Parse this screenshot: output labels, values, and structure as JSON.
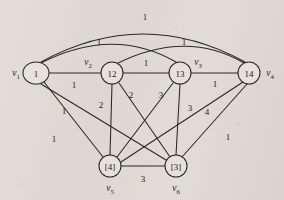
{
  "diagram": {
    "type": "weighted-undirected-graph",
    "title": "",
    "background_color": "#ded9d2",
    "stroke_color": "#2a2724",
    "node_fill": "#e6e2db",
    "nodes": [
      {
        "id": "v1",
        "label": "1",
        "vertex_label": "v",
        "vertex_sub": "1",
        "cx": 36,
        "cy": 73,
        "r": 11,
        "rx": 13,
        "label_x": 16,
        "label_y": 73
      },
      {
        "id": "v2",
        "label": "12",
        "vertex_label": "v",
        "vertex_sub": "2",
        "cx": 112,
        "cy": 73,
        "r": 11,
        "rx": 11,
        "label_x": 88,
        "label_y": 62
      },
      {
        "id": "v3",
        "label": "13",
        "vertex_label": "v",
        "vertex_sub": "3",
        "cx": 180,
        "cy": 73,
        "r": 11,
        "rx": 11,
        "label_x": 198,
        "label_y": 62
      },
      {
        "id": "v4",
        "label": "14",
        "vertex_label": "v",
        "vertex_sub": "4",
        "cx": 249,
        "cy": 73,
        "r": 11,
        "rx": 11,
        "label_x": 270,
        "label_y": 73
      },
      {
        "id": "v5",
        "label": "[4]",
        "vertex_label": "v",
        "vertex_sub": "5",
        "cx": 110,
        "cy": 166,
        "r": 11,
        "rx": 11,
        "label_x": 110,
        "label_y": 188
      },
      {
        "id": "v6",
        "label": "[3]",
        "vertex_label": "v",
        "vertex_sub": "6",
        "cx": 176,
        "cy": 166,
        "r": 11,
        "rx": 11,
        "label_x": 176,
        "label_y": 188
      }
    ],
    "edges": [
      {
        "from": "v1",
        "to": "v4",
        "weight": "1",
        "shape": "arc",
        "path": "M 41 62 Q 143 6 245 62",
        "wx": 145,
        "wy": 17
      },
      {
        "from": "v1",
        "to": "v3",
        "weight": "1",
        "shape": "arc",
        "path": "M 41 63 Q 113 26 176 62",
        "wx": 99,
        "wy": 42
      },
      {
        "from": "v2",
        "to": "v4",
        "weight": "1",
        "shape": "arc",
        "path": "M 116 64 Q 186 29 244 63",
        "wx": 184,
        "wy": 42
      },
      {
        "from": "v1",
        "to": "v2",
        "weight": "1",
        "shape": "straight",
        "path": "M 49 73 L 101 73",
        "wx": 74,
        "wy": 85
      },
      {
        "from": "v2",
        "to": "v3",
        "weight": "1",
        "shape": "straight",
        "path": "M 123 73 L 169 73",
        "wx": 146,
        "wy": 63
      },
      {
        "from": "v3",
        "to": "v4",
        "weight": "1",
        "shape": "straight",
        "path": "M 191 73 L 238 73",
        "wx": 215,
        "wy": 84
      },
      {
        "from": "v1",
        "to": "v5",
        "weight": "1",
        "shape": "straight",
        "path": "M 44 82 L 103 157",
        "wx": 64,
        "wy": 111
      },
      {
        "from": "v1",
        "to": "v6",
        "weight": "1",
        "shape": "straight",
        "path": "M 41 84 L 166 160",
        "wx": 54,
        "wy": 139
      },
      {
        "from": "v2",
        "to": "v5",
        "weight": "2",
        "shape": "straight",
        "path": "M 112 84 L 110 155",
        "wx": 101,
        "wy": 105
      },
      {
        "from": "v2",
        "to": "v6",
        "weight": "2",
        "shape": "straight",
        "path": "M 119 83 L 170 157",
        "wx": 131,
        "wy": 95
      },
      {
        "from": "v3",
        "to": "v5",
        "weight": "3",
        "shape": "straight",
        "path": "M 173 83 L 117 157",
        "wx": 161,
        "wy": 95
      },
      {
        "from": "v3",
        "to": "v6",
        "weight": "3",
        "shape": "straight",
        "path": "M 180 84 L 176 155",
        "wx": 190,
        "wy": 108
      },
      {
        "from": "v5",
        "to": "v4",
        "weight": "4",
        "shape": "straight",
        "path": "M 121 162 L 243 82",
        "wx": 207,
        "wy": 112
      },
      {
        "from": "v6",
        "to": "v4",
        "weight": "1",
        "shape": "straight",
        "path": "M 182 157 L 247 84",
        "wx": 228,
        "wy": 137
      },
      {
        "from": "v5",
        "to": "v6",
        "weight": "3",
        "shape": "straight",
        "path": "M 121 166 L 165 166",
        "wx": 143,
        "wy": 179
      }
    ]
  }
}
